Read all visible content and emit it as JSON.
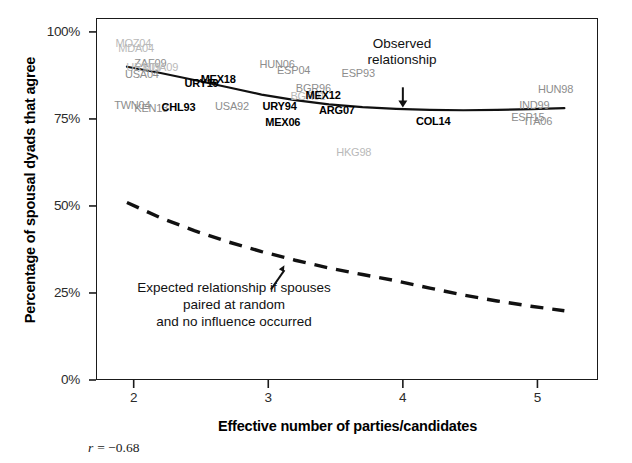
{
  "chart_data": {
    "type": "scatter",
    "title": "",
    "xlabel": "Effective number of parties/candidates",
    "ylabel": "Percentage of spousal dyads that agree",
    "xlim": [
      1.72,
      5.45
    ],
    "ylim": [
      0,
      104
    ],
    "xticks": [
      "2",
      "3",
      "4",
      "5"
    ],
    "xtick_values": [
      2,
      3,
      4,
      5
    ],
    "yticks": [
      "0%",
      "25%",
      "50%",
      "75%",
      "100%"
    ],
    "ytick_values": [
      0,
      25,
      50,
      75,
      100
    ],
    "grid": false,
    "legend": "none",
    "correlation_note": "r = −0.68",
    "correlation_symbol": "r",
    "correlation_value": "= −0.68",
    "annotations": [
      {
        "name": "observed-relationship",
        "lines": [
          "Observed",
          "relationship"
        ],
        "arrow": "down",
        "x": 4.0,
        "y": 80
      },
      {
        "name": "expected-relationship",
        "lines": [
          "Expected relationship if spouses",
          "paired at random",
          "and no influence occurred"
        ],
        "arrow": "up",
        "x": 3.05,
        "y": 32
      }
    ],
    "series": [
      {
        "name": "Observed relationship",
        "style": "solid",
        "color": "#111111",
        "x": [
          1.95,
          2.2,
          2.45,
          2.7,
          2.95,
          3.2,
          3.45,
          3.7,
          3.95,
          4.2,
          4.45,
          4.7,
          4.95,
          5.2
        ],
        "y": [
          90.0,
          88.2,
          86.2,
          84.1,
          82.0,
          80.4,
          79.2,
          78.4,
          77.9,
          77.6,
          77.5,
          77.6,
          77.8,
          78.1
        ]
      },
      {
        "name": "Expected relationship if spouses paired at random and no influence occurred",
        "style": "dashed",
        "color": "#111111",
        "x": [
          1.95,
          2.2,
          2.45,
          2.7,
          2.95,
          3.2,
          3.45,
          3.7,
          3.95,
          4.2,
          4.45,
          4.7,
          4.95,
          5.2
        ],
        "y": [
          51.0,
          46.6,
          42.9,
          39.7,
          36.9,
          34.4,
          32.2,
          30.3,
          28.5,
          26.4,
          24.4,
          22.7,
          21.2,
          19.9
        ]
      }
    ],
    "points": [
      {
        "label": "MOZ04",
        "x": 1.98,
        "y": 96.5,
        "emphasis": "faint"
      },
      {
        "label": "MDA04",
        "x": 2.0,
        "y": 95.2,
        "emphasis": "faint"
      },
      {
        "label": "ZAF09",
        "x": 2.12,
        "y": 90.9,
        "emphasis": "gray"
      },
      {
        "label": "URY09",
        "x": 2.06,
        "y": 89.6,
        "emphasis": "faint"
      },
      {
        "label": "MDA09",
        "x": 2.18,
        "y": 89.6,
        "emphasis": "faint"
      },
      {
        "label": "USA04",
        "x": 2.05,
        "y": 87.6,
        "emphasis": "gray"
      },
      {
        "label": "URY19",
        "x": 2.5,
        "y": 85.0,
        "emphasis": "bold"
      },
      {
        "label": "MEX18",
        "x": 2.62,
        "y": 86.2,
        "emphasis": "bold"
      },
      {
        "label": "HUN06",
        "x": 3.05,
        "y": 90.5,
        "emphasis": "gray"
      },
      {
        "label": "ESP04",
        "x": 3.18,
        "y": 88.8,
        "emphasis": "gray"
      },
      {
        "label": "ESP93",
        "x": 3.66,
        "y": 87.8,
        "emphasis": "gray"
      },
      {
        "label": "BGR96",
        "x": 3.32,
        "y": 83.5,
        "emphasis": "gray"
      },
      {
        "label": "BGR01",
        "x": 3.28,
        "y": 81.4,
        "emphasis": "faint"
      },
      {
        "label": "MEX12",
        "x": 3.4,
        "y": 81.6,
        "emphasis": "bold"
      },
      {
        "label": "TWN04",
        "x": 1.97,
        "y": 78.6,
        "emphasis": "gray"
      },
      {
        "label": "KEN13",
        "x": 2.12,
        "y": 78.0,
        "emphasis": "gray"
      },
      {
        "label": "CHL93",
        "x": 2.33,
        "y": 78.2,
        "emphasis": "bold"
      },
      {
        "label": "USA92",
        "x": 2.72,
        "y": 78.4,
        "emphasis": "gray"
      },
      {
        "label": "URY94",
        "x": 3.08,
        "y": 78.5,
        "emphasis": "bold"
      },
      {
        "label": "ARG07",
        "x": 3.5,
        "y": 77.2,
        "emphasis": "bold"
      },
      {
        "label": "MEX06",
        "x": 3.1,
        "y": 73.9,
        "emphasis": "bold"
      },
      {
        "label": "COL14",
        "x": 4.22,
        "y": 74.0,
        "emphasis": "bold"
      },
      {
        "label": "HKG98",
        "x": 3.62,
        "y": 65.3,
        "emphasis": "faint"
      },
      {
        "label": "HUN98",
        "x": 5.12,
        "y": 83.2,
        "emphasis": "gray"
      },
      {
        "label": "IND99",
        "x": 4.98,
        "y": 78.8,
        "emphasis": "gray"
      },
      {
        "label": "ESP15",
        "x": 4.92,
        "y": 75.3,
        "emphasis": "gray"
      },
      {
        "label": "ITA06",
        "x": 5.02,
        "y": 74.1,
        "emphasis": "gray"
      }
    ]
  }
}
